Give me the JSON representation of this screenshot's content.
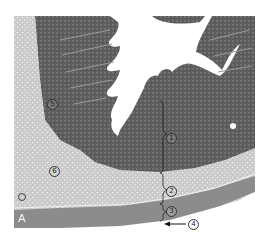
{
  "figure": {
    "panel_letter": "A",
    "labels": [
      {
        "id": "1",
        "text": "①",
        "x": 166,
        "y": 133
      },
      {
        "id": "2",
        "text": "②",
        "x": 166,
        "y": 186
      },
      {
        "id": "3",
        "text": "③",
        "x": 166,
        "y": 206
      },
      {
        "id": "4",
        "text": "④",
        "x": 188,
        "y": 221
      },
      {
        "id": "5",
        "text": "⑤",
        "x": 47,
        "y": 99
      },
      {
        "id": "6",
        "text": "⑥",
        "x": 49,
        "y": 166
      }
    ],
    "colors": {
      "mucosa": "#5a5a5a",
      "submucosa": "#c8c8c8",
      "muscularis": "#8a8a8a",
      "lumen": "#ffffff",
      "background": "#ffffff"
    }
  }
}
